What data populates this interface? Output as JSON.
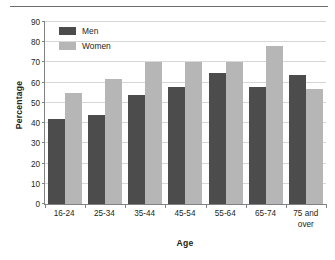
{
  "chart_data": {
    "type": "bar",
    "title": "",
    "xlabel": "Age",
    "ylabel": "Percentage",
    "categories": [
      "16-24",
      "25-34",
      "35-44",
      "45-54",
      "55-64",
      "65-74",
      "75 and over"
    ],
    "series": [
      {
        "name": "Men",
        "color": "#4c4c4c",
        "values": [
          42,
          44,
          54,
          58,
          65,
          58,
          64
        ]
      },
      {
        "name": "Women",
        "color": "#b6b6b6",
        "values": [
          55,
          62,
          70,
          70,
          70,
          78,
          57
        ]
      }
    ],
    "ylim": [
      0,
      90
    ],
    "ytick_values": [
      0,
      10,
      20,
      30,
      40,
      50,
      60,
      70,
      80,
      90
    ],
    "ytick_labels": [
      "0",
      "10",
      "20",
      "30",
      "40",
      "50",
      "60",
      "70",
      "80",
      "90"
    ],
    "grid": true,
    "legend_position": "top-left",
    "bar_style": "grouped"
  },
  "colors": {
    "men": "#4c4c4c",
    "women": "#b6b6b6",
    "axis": "#808285",
    "grid": "#d6d7d8",
    "rule": "#6d6e71",
    "text": "#231f20"
  }
}
